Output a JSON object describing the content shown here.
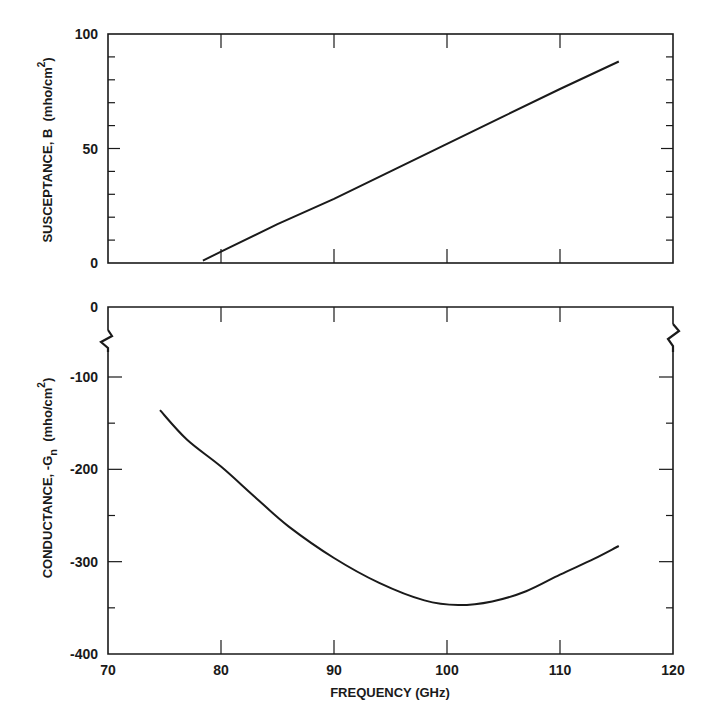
{
  "chart_data": [
    {
      "type": "line",
      "panel": "top",
      "title": "",
      "xlabel": "FREQUENCY (GHz)",
      "ylabel": "SUSCEPTANCE, B (mho/cm²)",
      "ylabel_parts": {
        "main": "SUSCEPTANCE, B",
        "unit_pre": "(mho/cm",
        "unit_sup": "2",
        "unit_post": ")"
      },
      "xlim": [
        70,
        120
      ],
      "ylim": [
        0,
        100
      ],
      "x_ticks": [
        70,
        80,
        90,
        100,
        110,
        120
      ],
      "y_ticks": [
        0,
        50,
        100
      ],
      "y_tick_labels": [
        "0",
        "50",
        "100"
      ],
      "y_minor_step": 10,
      "grid": false,
      "series": [
        {
          "name": "Susceptance B",
          "x": [
            78.4,
            80,
            85,
            90,
            95,
            100,
            105,
            110,
            115.2
          ],
          "y": [
            1,
            5,
            17,
            28,
            40,
            52,
            64,
            76,
            88
          ]
        }
      ]
    },
    {
      "type": "line",
      "panel": "bottom",
      "title": "",
      "xlabel": "FREQUENCY (GHz)",
      "ylabel": "CONDUCTANCE, -Gn (mho/cm²)",
      "ylabel_parts": {
        "main": "CONDUCTANCE, -G",
        "sub": "n",
        "unit_pre": "(mho/cm",
        "unit_sup": "2",
        "unit_post": ")"
      },
      "xlim": [
        70,
        120
      ],
      "ylim": [
        -400,
        0
      ],
      "axis_break": "between 0 and -100",
      "x_ticks": [
        70,
        80,
        90,
        100,
        110,
        120
      ],
      "x_tick_labels": [
        "70",
        "80",
        "90",
        "100",
        "110",
        "120"
      ],
      "y_ticks": [
        0,
        -100,
        -200,
        -300,
        -400
      ],
      "y_tick_labels": [
        "0",
        "-100",
        "-200",
        "-300",
        "-400"
      ],
      "y_minor_ticks": [
        -150,
        -250,
        -350
      ],
      "grid": false,
      "series": [
        {
          "name": "Conductance -Gn",
          "x": [
            74.6,
            77,
            80,
            83,
            86,
            90,
            94,
            98,
            101,
            104,
            107,
            110,
            113,
            115.2
          ],
          "y": [
            -136,
            -168,
            -197,
            -230,
            -262,
            -296,
            -323,
            -342,
            -347,
            -343,
            -332,
            -314,
            -297,
            -283
          ]
        }
      ]
    }
  ]
}
